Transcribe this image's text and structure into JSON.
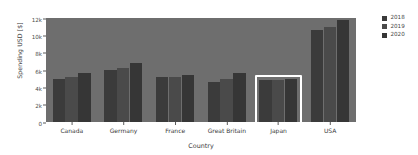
{
  "chart_data": {
    "type": "bar",
    "title": "",
    "subtitle": "",
    "xlabel": "Country",
    "ylabel": "Spending USD [$]",
    "categories": [
      "Canada",
      "Germany",
      "France",
      "Great Britain",
      "Japan",
      "USA"
    ],
    "series": [
      {
        "name": "2018",
        "color": "#3b3b3b",
        "values": [
          5000,
          6000,
          5200,
          4600,
          4800,
          10600
        ]
      },
      {
        "name": "2019",
        "color": "#4a4a4a",
        "values": [
          5200,
          6200,
          5200,
          5000,
          4900,
          11000
        ]
      },
      {
        "name": "2020",
        "color": "#363636",
        "values": [
          5600,
          6800,
          5400,
          5600,
          5000,
          11800
        ]
      }
    ],
    "ylim": [
      0,
      12000
    ],
    "yticks": [
      0,
      2000,
      4000,
      6000,
      8000,
      10000,
      12000
    ],
    "ytick_labels": [
      "0",
      "2k",
      "4k",
      "6k",
      "8k",
      "10k",
      "12k"
    ],
    "grid": false,
    "legend_position": "right",
    "legend_entries": [
      "2018",
      "2019",
      "2020"
    ],
    "plot_background": "#6e6e6e",
    "figure_background": "#ffffff",
    "annotations": [
      {
        "type": "selection-rectangle",
        "target_category": "Japan",
        "color": "#ffffff",
        "description": "white highlight box around the Japan bar group"
      }
    ]
  }
}
